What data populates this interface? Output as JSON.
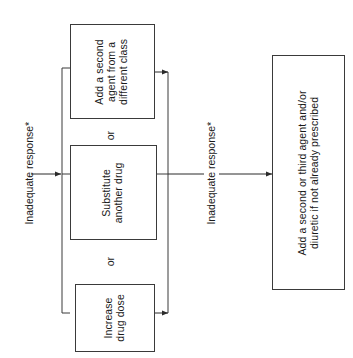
{
  "diagram": {
    "orientation": "rotated-90-ccw",
    "nodes": [
      {
        "id": "add-second-agent",
        "label": "Add a second\nagent from a\ndifferent class",
        "lines": [
          "Add a second",
          "agent from a",
          "different class"
        ]
      },
      {
        "id": "substitute-drug",
        "label": "Substitute\nanother drug",
        "lines": [
          "Substitute",
          "another drug"
        ]
      },
      {
        "id": "increase-dose",
        "label": "Increase\ndrug dose",
        "lines": [
          "Increase",
          "drug dose"
        ]
      },
      {
        "id": "add-second-or-third",
        "label": "Add a second or third agent and/or\ndiuretic if not already prescribed",
        "lines": [
          "Add a second or third agent and/or",
          "diuretic if not already prescribed"
        ]
      }
    ],
    "edge_labels": [
      {
        "id": "inadequate-response-1",
        "text": "Inadequate response*"
      },
      {
        "id": "inadequate-response-2",
        "text": "Inadequate response*"
      }
    ],
    "connector_labels": [
      {
        "id": "or-1",
        "text": "or"
      },
      {
        "id": "or-2",
        "text": "or"
      }
    ],
    "colors": {
      "stroke": "#3a3a3a",
      "text": "#1a1a1a",
      "background": "#ffffff"
    }
  }
}
